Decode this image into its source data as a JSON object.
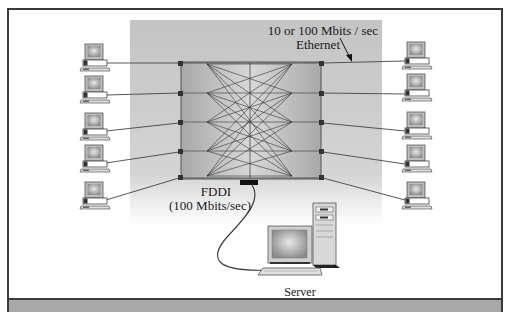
{
  "diagram": {
    "type": "network-topology",
    "labels": {
      "ethernet_speed": "10 or 100 Mbits / sec",
      "ethernet": "Ethernet",
      "fddi": "FDDI",
      "fddi_speed": "(100 Mbits/sec)",
      "server": "Server"
    },
    "nodes": {
      "switch": {
        "label": "",
        "ports_left": 5,
        "ports_right": 5,
        "uplink": "FDDI"
      },
      "workstations_left": [
        {
          "id": "pc-l1"
        },
        {
          "id": "pc-l2"
        },
        {
          "id": "pc-l3"
        },
        {
          "id": "pc-l4"
        },
        {
          "id": "pc-l5"
        }
      ],
      "workstations_right": [
        {
          "id": "pc-r1"
        },
        {
          "id": "pc-r2"
        },
        {
          "id": "pc-r3"
        },
        {
          "id": "pc-r4"
        },
        {
          "id": "pc-r5"
        }
      ],
      "server": {
        "id": "server"
      }
    },
    "colors": {
      "backdrop": "#c8c8c8",
      "switch_fill": "#b0b0b0",
      "line": "#3a3a3a",
      "footer_bar": "#a8a8a8"
    }
  }
}
